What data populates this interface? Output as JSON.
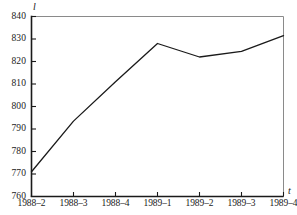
{
  "chart_data": {
    "type": "line",
    "title": "",
    "subtitle": "",
    "xlabel": "t",
    "ylabel": "l",
    "categories": [
      "1988–2",
      "1988–3",
      "1988–4",
      "1989–1",
      "1989–2",
      "1989–3",
      "1989–4"
    ],
    "values": [
      771,
      793.5,
      811,
      828,
      822,
      824.5,
      831.5
    ],
    "series": [
      {
        "name": "",
        "values": [
          771,
          793.5,
          811,
          828,
          822,
          824.5,
          831.5
        ]
      }
    ],
    "ylim": [
      760,
      840
    ],
    "yticks": [
      760,
      770,
      780,
      790,
      800,
      810,
      820,
      830,
      840
    ],
    "ytick_labels": [
      "760",
      "770",
      "780",
      "790",
      "800",
      "810",
      "820",
      "830",
      "840"
    ],
    "xtick_labels": [
      "1988–2",
      "1988–3",
      "1988–4",
      "1989–1",
      "1989–2",
      "1989–3",
      "1989–4"
    ],
    "grid": false,
    "legend": "none",
    "line_color": "#1a1a1a",
    "axis_color": "#1a1a1a",
    "frame_color": "#8a8a8a",
    "background": "#ffffff"
  },
  "axes": {
    "y_variable": "l",
    "x_variable": "t"
  }
}
